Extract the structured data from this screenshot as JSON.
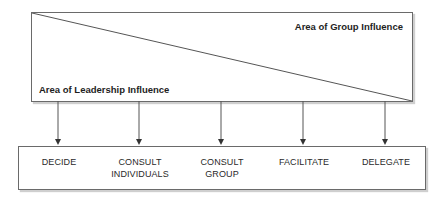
{
  "diagram": {
    "top_box": {
      "group_label": "Area of Group Influence",
      "leader_label": "Area of Leadership Influence"
    },
    "continuum": {
      "items": [
        {
          "line1": "DECIDE",
          "line2": "",
          "arrow_x": 58
        },
        {
          "line1": "CONSULT",
          "line2": "INDIVIDUALS",
          "arrow_x": 139
        },
        {
          "line1": "CONSULT",
          "line2": "GROUP",
          "arrow_x": 221
        },
        {
          "line1": "FACILITATE",
          "line2": "",
          "arrow_x": 303
        },
        {
          "line1": "DELEGATE",
          "line2": "",
          "arrow_x": 385
        }
      ]
    },
    "colors": {
      "line": "#555555",
      "border": "#6a6a6a",
      "shadow": "#cfcfcf",
      "text": "#222222"
    }
  }
}
